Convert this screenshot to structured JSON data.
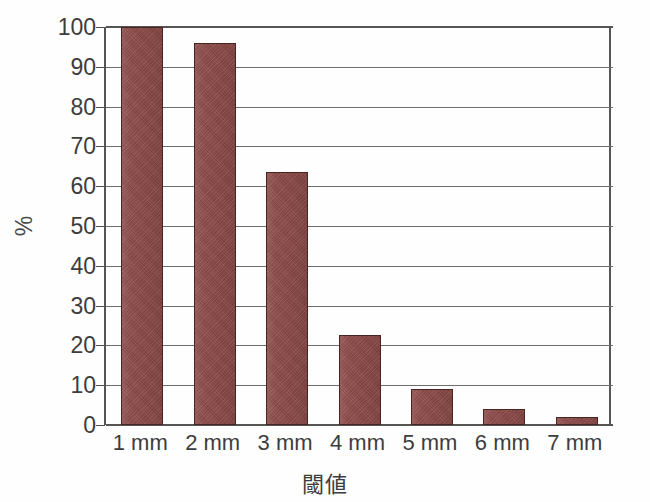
{
  "chart_data": {
    "type": "bar",
    "title": "",
    "subtitle": "",
    "xlabel": "閾値",
    "ylabel": "%",
    "categories": [
      "1 mm",
      "2 mm",
      "3 mm",
      "4 mm",
      "5 mm",
      "6 mm",
      "7 mm"
    ],
    "values": [
      100,
      96,
      63.5,
      22.5,
      9,
      4,
      2
    ],
    "series": [
      {
        "name": "",
        "values": [
          100,
          96,
          63.5,
          22.5,
          9,
          4,
          2
        ]
      }
    ],
    "ylim": [
      0,
      100
    ],
    "yticks": [
      0,
      10,
      20,
      30,
      40,
      50,
      60,
      70,
      80,
      90,
      100
    ],
    "ytick_labels": [
      "0",
      "10",
      "20",
      "30",
      "40",
      "50",
      "60",
      "70",
      "80",
      "90",
      "100"
    ],
    "grid": true,
    "grid_axis": "y",
    "legend": false,
    "legend_position": "none",
    "bar_color": "#8e4b48",
    "bar_edge_color": "#4a2420",
    "axis_color": "#555555",
    "grid_color": "#6e6e6e",
    "background_color": "#ffffff",
    "text_color": "#3d3d3d"
  }
}
